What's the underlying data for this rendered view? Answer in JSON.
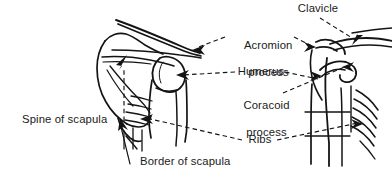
{
  "figure": {
    "type": "anatomical-line-diagram",
    "background_color": "#ffffff",
    "ink_color": "#141414",
    "views": [
      {
        "name": "posterior-view-scapula",
        "position": "left"
      },
      {
        "name": "lateral-view-shoulder",
        "position": "right"
      }
    ],
    "labels": [
      {
        "key": "clavicle",
        "text": "Clavicle",
        "lines": [
          "Clavicle"
        ],
        "align": "center",
        "leader": "dashed",
        "points_to": "clavicle-right-view"
      },
      {
        "key": "acromion_process",
        "text": "Acromion process",
        "lines": [
          "Acromion",
          "process"
        ],
        "align": "center",
        "leader": "dashed",
        "points_to": "acromion-both-views"
      },
      {
        "key": "humerus",
        "text": "Humerus",
        "lines": [
          "Humerus"
        ],
        "align": "center",
        "leader": "dashed",
        "points_to": "humerus-both-views"
      },
      {
        "key": "coracoid_process",
        "text": "Coracoid process",
        "lines": [
          "Coracoid",
          "process"
        ],
        "align": "center",
        "leader": "dashed",
        "points_to": "coracoid-right-view"
      },
      {
        "key": "ribs",
        "text": "Ribs",
        "lines": [
          "Ribs"
        ],
        "align": "center",
        "leader": "dashed",
        "points_to": "ribs-both-views"
      },
      {
        "key": "spine_of_scapula",
        "text": "Spine of scapula",
        "lines": [
          "Spine of scapula"
        ],
        "align": "left",
        "leader": "dashed",
        "points_to": "scapular-spine-left-view"
      },
      {
        "key": "border_of_scapula",
        "text": "Border of scapula",
        "lines": [
          "Border of scapula"
        ],
        "align": "left",
        "leader": "solid",
        "points_to": "inferior-border-left-view"
      }
    ]
  }
}
